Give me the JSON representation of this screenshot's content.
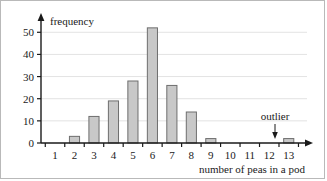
{
  "figure": {
    "border_color": "#b9b9b9",
    "background": "#ffffff"
  },
  "chart_data": {
    "type": "bar",
    "title": "",
    "xlabel": "number of peas in a pod",
    "ylabel": "frequency",
    "categories": [
      "1",
      "2",
      "3",
      "4",
      "5",
      "6",
      "7",
      "8",
      "9",
      "10",
      "11",
      "12",
      "13"
    ],
    "values": [
      0,
      3,
      12,
      19,
      28,
      52,
      26,
      14,
      2,
      0,
      0,
      0,
      2
    ],
    "ylim": [
      0,
      56
    ],
    "yticks": [
      "0",
      "10",
      "20",
      "30",
      "40",
      "50"
    ],
    "ytick_values": [
      0,
      10,
      20,
      30,
      40,
      50
    ],
    "grid": true,
    "grid_color": "#e3e3e3",
    "legend": "none",
    "bar_fill": "#c8c8c8",
    "bar_stroke": "#6e6e6e",
    "axis_color": "#1a1a1a",
    "annotations": [
      {
        "text": "outlier",
        "points_to_category": "13",
        "arrow": "down"
      }
    ]
  }
}
